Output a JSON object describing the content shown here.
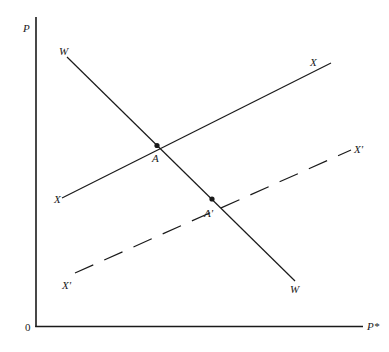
{
  "diagram": {
    "axes": {
      "y_label": "P",
      "x_label": "P*",
      "origin_label": "0"
    },
    "curves": {
      "W": {
        "label_start": "W",
        "label_end": "W",
        "style": "solid"
      },
      "X": {
        "label_start": "X",
        "label_end": "X",
        "style": "solid"
      },
      "X_prime": {
        "label_start": "X'",
        "label_end": "X'",
        "style": "dashed"
      }
    },
    "points": {
      "A": {
        "label": "A"
      },
      "A_prime": {
        "label": "A'"
      }
    },
    "colors": {
      "ink": "#1a1a1a",
      "background": "#ffffff"
    }
  }
}
